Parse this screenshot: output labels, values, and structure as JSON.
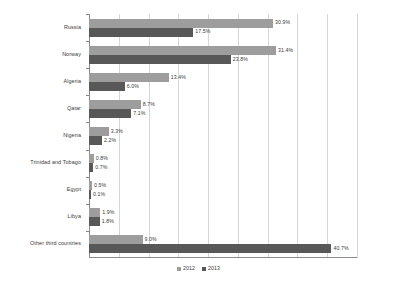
{
  "chart_data": {
    "type": "bar",
    "orientation": "horizontal",
    "title": "",
    "xlabel": "",
    "ylabel": "",
    "xlim": [
      0,
      45
    ],
    "grid": true,
    "gridline_count": 9,
    "legend_position": "bottom",
    "categories": [
      "Russia",
      "Norway",
      "Algeria",
      "Qatar",
      "Nigeria",
      "Trinidad and Tobago",
      "Egypt",
      "Libya",
      "Other third countries"
    ],
    "series": [
      {
        "name": "2012",
        "color": "#9d9d9d",
        "values": [
          30.9,
          31.4,
          13.4,
          8.7,
          3.3,
          0.8,
          0.5,
          1.9,
          9.0
        ],
        "labels": [
          "30.9%",
          "31.4%",
          "13.4%",
          "8.7%",
          "3.3%",
          "0.8%",
          "0.5%",
          "1.9%",
          "9.0%"
        ]
      },
      {
        "name": "2013",
        "color": "#585858",
        "values": [
          17.5,
          23.8,
          6.0,
          7.1,
          2.2,
          0.7,
          0.1,
          1.8,
          40.7
        ],
        "labels": [
          "17.5%",
          "23.8%",
          "6.0%",
          "7.1%",
          "2.2%",
          "0.7%",
          "0.1%",
          "1.8%",
          "40.7%"
        ]
      }
    ]
  },
  "legend": {
    "items": [
      {
        "label": "2012",
        "color": "#9d9d9d"
      },
      {
        "label": "2013",
        "color": "#585858"
      }
    ]
  }
}
